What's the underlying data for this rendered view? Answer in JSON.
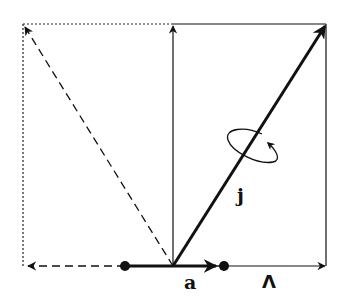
{
  "diagram": {
    "type": "vector-coupling",
    "labels": {
      "a": "a",
      "lambda": "Λ",
      "j": "j"
    },
    "colors": {
      "stroke": "#111111",
      "background": "#ffffff"
    },
    "geometry": {
      "origin": [
        173,
        266
      ],
      "box_left": 23,
      "box_right": 326,
      "box_top": 24,
      "baseline_y": 266,
      "dot_left_x": 125,
      "dot_right_x": 224
    },
    "elements": [
      {
        "name": "vector-j",
        "style": "thick-solid",
        "from": [
          173,
          266
        ],
        "to": [
          326,
          24
        ],
        "arrow": true
      },
      {
        "name": "vector-vertical",
        "style": "thin-solid",
        "from": [
          173,
          266
        ],
        "to": [
          173,
          24
        ],
        "arrow": true
      },
      {
        "name": "vector-reflected",
        "style": "dashed",
        "from": [
          173,
          266
        ],
        "to": [
          23,
          24
        ],
        "arrow": true
      },
      {
        "name": "vector-lambda",
        "style": "thin-solid",
        "from": [
          224,
          266
        ],
        "to": [
          326,
          266
        ],
        "arrow": true
      },
      {
        "name": "vector-a",
        "style": "thick-solid",
        "from": [
          125,
          266
        ],
        "to": [
          224,
          266
        ],
        "arrow": true
      },
      {
        "name": "vector-left-projection",
        "style": "dashed",
        "from": [
          125,
          266
        ],
        "to": [
          23,
          266
        ],
        "arrow": true
      },
      {
        "name": "precession-ellipse",
        "style": "thin-solid",
        "center": [
          250,
          148
        ],
        "arrow": true
      }
    ]
  }
}
